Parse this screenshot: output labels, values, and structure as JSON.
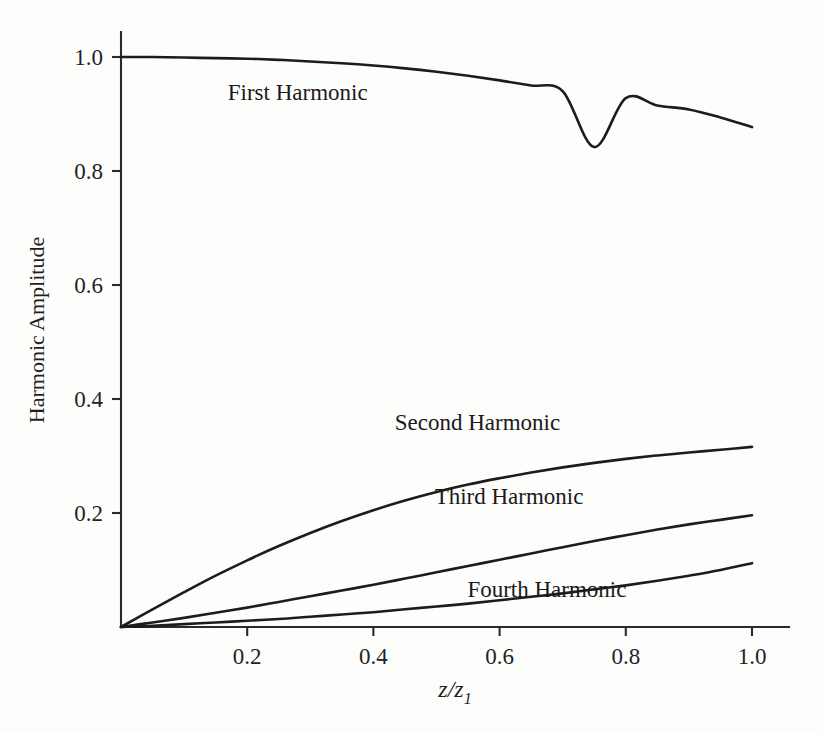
{
  "figure": {
    "background_color": "#fdfdfc",
    "ink_color": "#1c1c1c"
  },
  "chart_data": {
    "type": "line",
    "title": "",
    "xlabel": "z/z1",
    "xlabel_base": "z/z",
    "xlabel_sub": "1",
    "ylabel": "Harmonic Amplitude",
    "xlim": [
      0.0,
      1.0
    ],
    "ylim": [
      0.0,
      1.0
    ],
    "grid": false,
    "legend_position": "inline-annotations",
    "xticks": [
      0.2,
      0.4,
      0.6,
      0.8,
      1.0
    ],
    "xtick_labels": [
      "0.2",
      "0.4",
      "0.6",
      "0.8",
      "1.0"
    ],
    "yticks": [
      0.2,
      0.4,
      0.6,
      0.8,
      1.0
    ],
    "ytick_labels": [
      "0.2",
      "0.4",
      "0.6",
      "0.8",
      "1.0"
    ],
    "x": [
      0.0,
      0.05,
      0.1,
      0.15,
      0.2,
      0.25,
      0.3,
      0.35,
      0.4,
      0.45,
      0.5,
      0.55,
      0.6,
      0.65,
      0.7,
      0.75,
      0.8,
      0.85,
      0.9,
      0.95,
      1.0
    ],
    "series": [
      {
        "name": "First Harmonic",
        "label": "First Harmonic",
        "label_x": 0.28,
        "label_y": 0.925,
        "values": [
          1.0,
          1.0,
          0.999,
          0.998,
          0.997,
          0.995,
          0.992,
          0.989,
          0.985,
          0.98,
          0.974,
          0.967,
          0.959,
          0.95,
          0.94,
          0.842,
          0.928,
          0.915,
          0.908,
          0.894,
          0.877
        ]
      },
      {
        "name": "Second Harmonic",
        "label": "Second Harmonic",
        "label_x": 0.565,
        "label_y": 0.345,
        "values": [
          0.0,
          0.031,
          0.061,
          0.09,
          0.117,
          0.142,
          0.165,
          0.186,
          0.205,
          0.222,
          0.237,
          0.25,
          0.261,
          0.271,
          0.28,
          0.288,
          0.295,
          0.301,
          0.306,
          0.311,
          0.316
        ]
      },
      {
        "name": "Third Harmonic",
        "label": "Third Harmonic",
        "label_x": 0.615,
        "label_y": 0.215,
        "values": [
          0.0,
          0.008,
          0.016,
          0.025,
          0.034,
          0.044,
          0.054,
          0.064,
          0.074,
          0.085,
          0.096,
          0.107,
          0.118,
          0.129,
          0.14,
          0.151,
          0.161,
          0.171,
          0.18,
          0.188,
          0.196
        ]
      },
      {
        "name": "Fourth Harmonic",
        "label": "Fourth Harmonic",
        "label_x": 0.675,
        "label_y": 0.052,
        "values": [
          0.0,
          0.002,
          0.005,
          0.008,
          0.011,
          0.014,
          0.018,
          0.022,
          0.026,
          0.031,
          0.036,
          0.041,
          0.047,
          0.053,
          0.059,
          0.066,
          0.073,
          0.081,
          0.09,
          0.1,
          0.112
        ]
      }
    ]
  }
}
